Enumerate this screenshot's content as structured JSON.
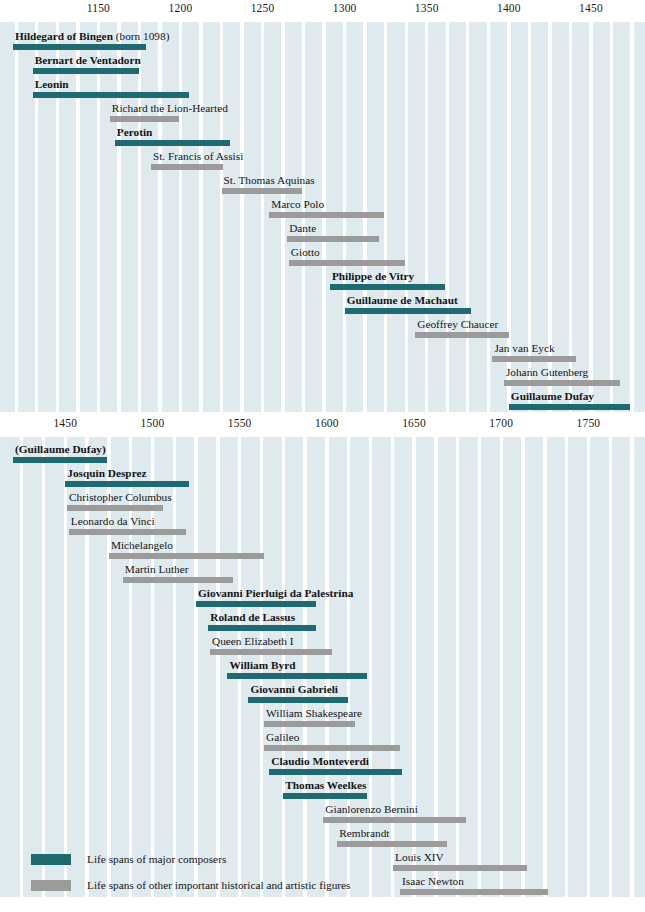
{
  "chart_data": {
    "type": "bar",
    "chart_kind": "horizontal-timeline-gantt",
    "title": "",
    "xlabel": "",
    "ylabel": "",
    "grid": true,
    "legend_position": "bottom-left",
    "colors": {
      "composer": "#1d6a70",
      "figure": "#9b9b9b",
      "plot_background": "#dfeaef",
      "stripe": "#ffffff",
      "page_background": "#ffffff",
      "text": "#141414"
    },
    "panels": [
      {
        "id": "panel-1",
        "xlim": [
          1098,
          1475
        ],
        "ticks": [
          1150,
          1200,
          1250,
          1300,
          1350,
          1400,
          1450
        ],
        "tick_labels": [
          "1150",
          "1200",
          "1250",
          "1300",
          "1350",
          "1400",
          "1450"
        ],
        "rows": [
          {
            "label": "Hildegard of Bingen",
            "suffix": " (born 1098)",
            "kind": "composer",
            "start": 1098,
            "end": 1179
          },
          {
            "label": "Bernart de Ventadorn",
            "suffix": "",
            "kind": "composer",
            "start": 1110,
            "end": 1175
          },
          {
            "label": "Leonin",
            "suffix": "",
            "kind": "composer",
            "start": 1110,
            "end": 1205
          },
          {
            "label": "Richard the Lion-Hearted",
            "suffix": "",
            "kind": "figure",
            "start": 1157,
            "end": 1199
          },
          {
            "label": "Perotin",
            "suffix": "",
            "kind": "composer",
            "start": 1160,
            "end": 1230
          },
          {
            "label": "St. Francis of Assisi",
            "suffix": "",
            "kind": "figure",
            "start": 1182,
            "end": 1226
          },
          {
            "label": "St. Thomas Aquinas",
            "suffix": "",
            "kind": "figure",
            "start": 1225,
            "end": 1274
          },
          {
            "label": "Marco Polo",
            "suffix": "",
            "kind": "figure",
            "start": 1254,
            "end": 1324
          },
          {
            "label": "Dante",
            "suffix": "",
            "kind": "figure",
            "start": 1265,
            "end": 1321
          },
          {
            "label": "Giotto",
            "suffix": "",
            "kind": "figure",
            "start": 1266,
            "end": 1337
          },
          {
            "label": "Philippe de Vitry",
            "suffix": "",
            "kind": "composer",
            "start": 1291,
            "end": 1361
          },
          {
            "label": "Guillaume de Machaut",
            "suffix": "",
            "kind": "composer",
            "start": 1300,
            "end": 1377
          },
          {
            "label": "Geoffrey Chaucer",
            "suffix": "",
            "kind": "figure",
            "start": 1343,
            "end": 1400
          },
          {
            "label": "Jan van Eyck",
            "suffix": "",
            "kind": "figure",
            "start": 1390,
            "end": 1441
          },
          {
            "label": "Johann Gutenberg",
            "suffix": "",
            "kind": "figure",
            "start": 1397,
            "end": 1468
          },
          {
            "label": "Guillaume Dufay",
            "suffix": "",
            "kind": "composer",
            "start": 1400,
            "end": 1474
          },
          {
            "label": "Joan of Arc",
            "suffix": "",
            "kind": "figure",
            "start": 1412,
            "end": 1431
          },
          {
            "label": "François Villon",
            "suffix": "",
            "kind": "figure",
            "start": 1431,
            "end": 1463
          }
        ]
      },
      {
        "id": "panel-2",
        "xlim": [
          1420,
          1775
        ],
        "ticks": [
          1450,
          1500,
          1550,
          1600,
          1650,
          1700,
          1750
        ],
        "tick_labels": [
          "1450",
          "1500",
          "1550",
          "1600",
          "1650",
          "1700",
          "1750"
        ],
        "rows": [
          {
            "label": "(Guillaume Dufay)",
            "suffix": "",
            "kind": "composer",
            "start": 1420,
            "end": 1474
          },
          {
            "label": "Josquin Desprez",
            "suffix": "",
            "kind": "composer",
            "start": 1450,
            "end": 1521
          },
          {
            "label": "Christopher Columbus",
            "suffix": "",
            "kind": "figure",
            "start": 1451,
            "end": 1506
          },
          {
            "label": "Leonardo da Vinci",
            "suffix": "",
            "kind": "figure",
            "start": 1452,
            "end": 1519
          },
          {
            "label": "Michelangelo",
            "suffix": "",
            "kind": "figure",
            "start": 1475,
            "end": 1564
          },
          {
            "label": "Martin Luther",
            "suffix": "",
            "kind": "figure",
            "start": 1483,
            "end": 1546
          },
          {
            "label": "Giovanni Pierluigi da Palestrina",
            "suffix": "",
            "kind": "composer",
            "start": 1525,
            "end": 1594
          },
          {
            "label": "Roland de Lassus",
            "suffix": "",
            "kind": "composer",
            "start": 1532,
            "end": 1594
          },
          {
            "label": "Queen Elizabeth I",
            "suffix": "",
            "kind": "figure",
            "start": 1533,
            "end": 1603
          },
          {
            "label": "William Byrd",
            "suffix": "",
            "kind": "composer",
            "start": 1543,
            "end": 1623
          },
          {
            "label": "Giovanni Gabrieli",
            "suffix": "",
            "kind": "composer",
            "start": 1555,
            "end": 1612
          },
          {
            "label": "William Shakespeare",
            "suffix": "",
            "kind": "figure",
            "start": 1564,
            "end": 1616
          },
          {
            "label": "Galileo",
            "suffix": "",
            "kind": "figure",
            "start": 1564,
            "end": 1642
          },
          {
            "label": "Claudio Monteverdi",
            "suffix": "",
            "kind": "composer",
            "start": 1567,
            "end": 1643
          },
          {
            "label": "Thomas Weelkes",
            "suffix": "",
            "kind": "composer",
            "start": 1575,
            "end": 1623
          },
          {
            "label": "Gianlorenzo Bernini",
            "suffix": "",
            "kind": "figure",
            "start": 1598,
            "end": 1680
          },
          {
            "label": "Rembrandt",
            "suffix": "",
            "kind": "figure",
            "start": 1606,
            "end": 1669
          },
          {
            "label": "Louis XIV",
            "suffix": "",
            "kind": "figure",
            "start": 1638,
            "end": 1715
          },
          {
            "label": "Isaac Newton",
            "suffix": "",
            "kind": "figure",
            "start": 1642,
            "end": 1727
          },
          {
            "label": "Arcangelo Corelli",
            "suffix": "",
            "kind": "composer",
            "start": 1653,
            "end": 1713
          },
          {
            "label": "Henry Purcell",
            "suffix": "",
            "kind": "composer",
            "start": 1659,
            "end": 1695
          }
        ]
      }
    ],
    "legend": [
      {
        "kind": "composer",
        "text": "Life spans of major composers"
      },
      {
        "kind": "figure",
        "text": "Life spans of other important historical and artistic figures"
      }
    ]
  }
}
